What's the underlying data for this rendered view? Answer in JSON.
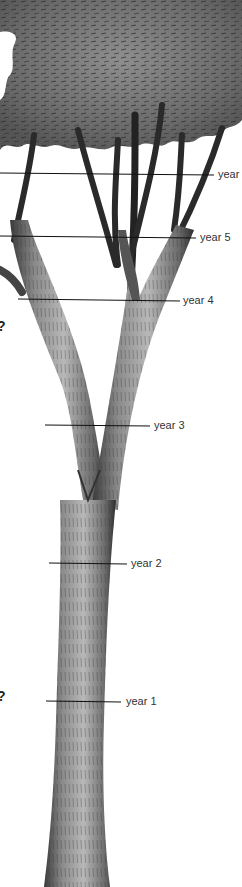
{
  "diagram": {
    "markers": [
      {
        "label": "year",
        "y": 173,
        "line_x1": 0,
        "line_x2": 214,
        "label_x": 218
      },
      {
        "label": "year 5",
        "y": 237,
        "line_x1": 0,
        "line_x2": 196,
        "label_x": 200
      },
      {
        "label": "year 4",
        "y": 300,
        "line_x1": 18,
        "line_x2": 180,
        "label_x": 183
      },
      {
        "label": "year 3",
        "y": 425,
        "line_x1": 45,
        "line_x2": 150,
        "label_x": 154
      },
      {
        "label": "year 2",
        "y": 563,
        "line_x1": 49,
        "line_x2": 127,
        "label_x": 131
      },
      {
        "label": "year 1",
        "y": 701,
        "line_x1": 46,
        "line_x2": 121,
        "label_x": 126
      }
    ],
    "question_marks": [
      {
        "text": "?",
        "x": 0,
        "y": 319
      },
      {
        "text": "?",
        "x": 0,
        "y": 689
      }
    ]
  }
}
